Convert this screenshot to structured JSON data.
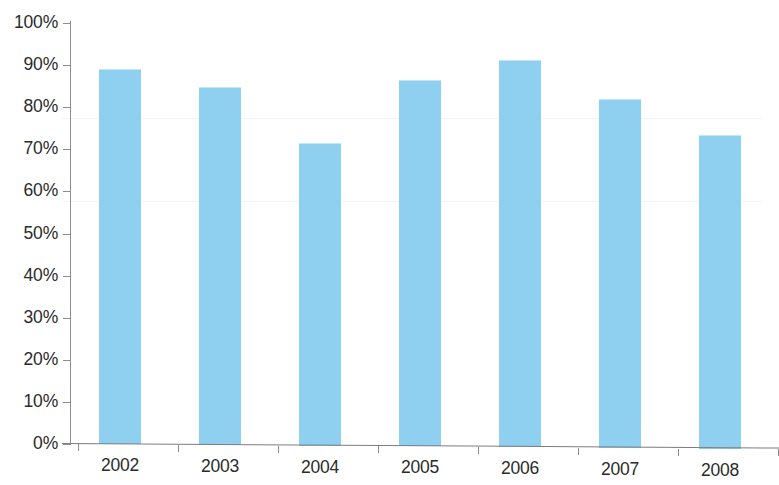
{
  "chart_data": {
    "type": "bar",
    "title": "",
    "subtitle": "",
    "xlabel": "",
    "ylabel": "",
    "categories": [
      "2002",
      "2003",
      "2004",
      "2005",
      "2006",
      "2007",
      "2008"
    ],
    "values": [
      89,
      85,
      72,
      87,
      92,
      83,
      74.5
    ],
    "series": [
      {
        "name": "",
        "values": [
          89,
          85,
          72,
          87,
          92,
          83,
          74.5
        ]
      }
    ],
    "ylim": [
      0,
      100
    ],
    "y_tick_labels": [
      "100%",
      "90%",
      "80%",
      "70%",
      "60%",
      "50%",
      "40%",
      "30%",
      "20%",
      "10%",
      "0%"
    ],
    "y_tick_values": [
      100,
      90,
      80,
      70,
      60,
      50,
      40,
      30,
      20,
      10,
      0
    ],
    "x_tick_labels": [
      "2002",
      "2003",
      "2004",
      "2005",
      "2006",
      "2007",
      "2008"
    ],
    "grid": false,
    "legend": false,
    "legend_position": "none",
    "annotations": [],
    "colors": {
      "bar_fill": "#8fcfef",
      "axis_line": "#8d8d8d",
      "tick_label": "#2b2b2b",
      "background": "#ffffff"
    }
  }
}
